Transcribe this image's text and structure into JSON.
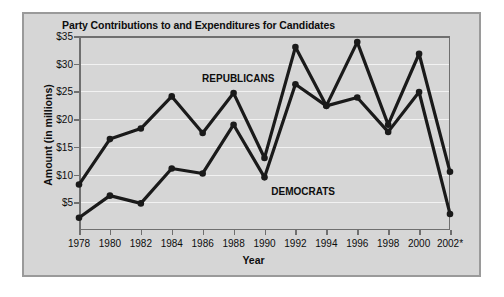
{
  "chart_data": {
    "type": "line",
    "title": "Party Contributions to and Expenditures for Candidates",
    "xlabel": "Year",
    "ylabel": "Amount (in millions)",
    "categories": [
      "1978",
      "1980",
      "1982",
      "1984",
      "1986",
      "1988",
      "1990",
      "1992",
      "1994",
      "1996",
      "1998",
      "2000",
      "2002*"
    ],
    "series": [
      {
        "name": "REPUBLICANS",
        "values": [
          8.2,
          16.4,
          18.3,
          24.1,
          17.5,
          24.7,
          13.0,
          33.0,
          22.4,
          33.9,
          19.0,
          31.8,
          10.5
        ],
        "color": "#1a1a1a"
      },
      {
        "name": "DEMOCRATS",
        "values": [
          2.2,
          6.2,
          4.8,
          11.1,
          10.2,
          19.0,
          9.5,
          26.3,
          22.4,
          23.9,
          17.7,
          24.9,
          2.9
        ],
        "color": "#1a1a1a"
      }
    ],
    "ytick_labels": [
      "$5",
      "$10",
      "$15",
      "$20",
      "$25",
      "$30",
      "$35"
    ],
    "ytick_values": [
      5,
      10,
      15,
      20,
      25,
      30,
      35
    ],
    "ylim": [
      0,
      35
    ],
    "xlim": [
      0,
      12
    ],
    "grid": true,
    "legend": "inline-annotations",
    "annotations": [
      {
        "label": "REPUBLICANS",
        "x_index": 5.15,
        "value": 27.4
      },
      {
        "label": "DEMOCRATS",
        "x_index": 7.25,
        "value": 7.1
      }
    ]
  },
  "figure": {
    "background_color": "#d6d6d6",
    "plot_background_color": "#d6d6d6",
    "border_color": "#9a9a9a",
    "axis_color": "#6f6f6f",
    "gridline_color": "#f2f2f2"
  }
}
